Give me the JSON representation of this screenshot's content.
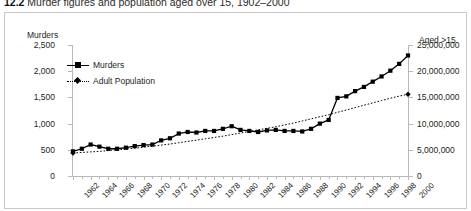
{
  "caption": {
    "number": "12.2",
    "text": "Murder figures and population aged over 15, 1902–2000"
  },
  "axes": {
    "left_title": "Murders",
    "right_title": "Aged >15",
    "left_ticks": [
      "0",
      "500",
      "1,000",
      "1,500",
      "2,000",
      "2,500"
    ],
    "right_ticks": [
      "0",
      "5,000,000",
      "10,000,000",
      "15,000,000",
      "20,000,000",
      "25,000,000"
    ]
  },
  "legend": {
    "items": [
      {
        "label": "Murders",
        "marker": "square",
        "style": "solid"
      },
      {
        "label": "Adult Population",
        "marker": "diamond",
        "style": "dotted"
      }
    ]
  },
  "chart_data": {
    "type": "line",
    "title": "Murder figures and population aged over 15, 1902–2000",
    "xlabel": "",
    "ylabel": "Murders",
    "y2label": "Aged >15",
    "ylim": [
      0,
      2500
    ],
    "y2lim": [
      0,
      25000000
    ],
    "xlim": [
      1962,
      2000
    ],
    "grid": false,
    "legend_position": "top-left",
    "x": [
      1962,
      1963,
      1964,
      1965,
      1966,
      1967,
      1968,
      1969,
      1970,
      1971,
      1972,
      1973,
      1974,
      1975,
      1976,
      1977,
      1978,
      1979,
      1980,
      1981,
      1982,
      1983,
      1984,
      1985,
      1986,
      1987,
      1988,
      1989,
      1990,
      1991,
      1992,
      1993,
      1994,
      1995,
      1996,
      1997,
      1998,
      1999,
      2000
    ],
    "xticklabels": [
      "1962",
      "1964",
      "1966",
      "1968",
      "1970",
      "1972",
      "1974",
      "1976",
      "1978",
      "1980",
      "1982",
      "1984",
      "1986",
      "1988",
      "1990",
      "1992",
      "1994",
      "1996",
      "1998",
      "2000"
    ],
    "series": [
      {
        "name": "Murders",
        "axis": "left",
        "marker": "square",
        "style": "solid",
        "values": [
          470,
          520,
          600,
          560,
          520,
          520,
          540,
          570,
          590,
          600,
          680,
          720,
          810,
          840,
          830,
          860,
          860,
          900,
          950,
          880,
          860,
          840,
          870,
          880,
          860,
          860,
          850,
          900,
          1000,
          1070,
          1490,
          1520,
          1620,
          1700,
          1800,
          1900,
          2010,
          2140,
          2300
        ]
      },
      {
        "name": "Adult Population",
        "axis": "right",
        "marker": "diamond",
        "style": "dotted",
        "values": [
          4400000,
          4500000,
          4600000,
          4700000,
          4850000,
          5000000,
          5150000,
          5300000,
          5500000,
          5700000,
          5900000,
          6100000,
          6350000,
          6600000,
          6850000,
          7100000,
          7350000,
          7600000,
          7900000,
          8200000,
          8500000,
          8800000,
          9100000,
          9400000,
          9750000,
          10100000,
          10500000,
          10900000,
          11300000,
          11700000,
          12150000,
          12600000,
          13050000,
          13500000,
          13950000,
          14400000,
          14850000,
          15250000,
          15600000
        ]
      }
    ]
  }
}
